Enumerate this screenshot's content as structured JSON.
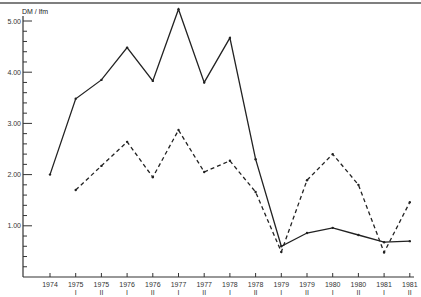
{
  "chart_data": {
    "type": "line",
    "title": "",
    "xlabel": "",
    "ylabel": "DM / lfm",
    "ylim": [
      0,
      5.2
    ],
    "grid": false,
    "legend": null,
    "y_ticks": [
      "5.00",
      "4.00",
      "3.00",
      "2.00",
      "1.00"
    ],
    "y_tick_values": [
      5,
      4,
      3,
      2,
      1
    ],
    "categories": [
      {
        "year": "1974",
        "half": ""
      },
      {
        "year": "1975",
        "half": "I"
      },
      {
        "year": "1975",
        "half": "II"
      },
      {
        "year": "1976",
        "half": "I"
      },
      {
        "year": "1976",
        "half": "II"
      },
      {
        "year": "1977",
        "half": "I"
      },
      {
        "year": "1977",
        "half": "II"
      },
      {
        "year": "1978",
        "half": "I"
      },
      {
        "year": "1978",
        "half": "II"
      },
      {
        "year": "1979",
        "half": "I"
      },
      {
        "year": "1979",
        "half": "II"
      },
      {
        "year": "1980",
        "half": "I"
      },
      {
        "year": "1980",
        "half": "II"
      },
      {
        "year": "1981",
        "half": "I"
      },
      {
        "year": "1981",
        "half": "II"
      }
    ],
    "series": [
      {
        "name": "solid",
        "style": "solid",
        "values": [
          2.0,
          3.48,
          3.85,
          4.48,
          3.83,
          5.23,
          3.8,
          4.67,
          2.3,
          0.6,
          0.86,
          0.96,
          0.82,
          0.68,
          0.7
        ]
      },
      {
        "name": "dashed",
        "style": "dashed",
        "values": [
          null,
          1.7,
          2.17,
          2.64,
          1.95,
          2.87,
          2.05,
          2.27,
          1.66,
          0.49,
          1.89,
          2.4,
          1.8,
          0.48,
          1.46
        ]
      }
    ]
  },
  "colors": {
    "line": "#222222",
    "axis": "#333333",
    "background": "#ffffff"
  }
}
